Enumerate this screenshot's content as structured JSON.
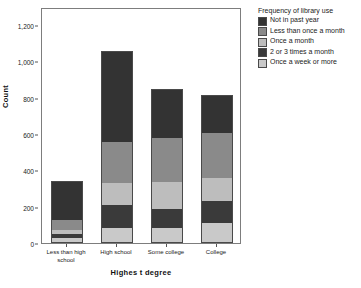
{
  "chart_data": {
    "type": "bar",
    "subtype": "stacked-bar",
    "title": "",
    "xlabel": "Highes t degree",
    "ylabel": "Count",
    "ylim": [
      0,
      1300
    ],
    "yticks": [
      "200",
      "400",
      "600",
      "800",
      "1,000",
      "1,200"
    ],
    "ytick_values": [
      200,
      400,
      600,
      800,
      1000,
      1200
    ],
    "grid": false,
    "legend_position": "right",
    "legend_title": "Frequency of library use",
    "categories": [
      "Less than high school",
      "High school",
      "Some college",
      "College"
    ],
    "series": [
      {
        "name": "Once a week or more",
        "color": "#c9c9c9",
        "values": [
          25,
          85,
          80,
          110
        ]
      },
      {
        "name": "2 or 3 times a month",
        "color": "#3a3a3a",
        "values": [
          25,
          125,
          110,
          120
        ]
      },
      {
        "name": "Once a month",
        "color": "#bdbdbd",
        "values": [
          20,
          120,
          145,
          130
        ]
      },
      {
        "name": "Less than once a month",
        "color": "#8a8a8a",
        "values": [
          55,
          225,
          245,
          245
        ]
      },
      {
        "name": "Not in past year",
        "color": "#333333",
        "values": [
          215,
          505,
          270,
          210
        ]
      }
    ],
    "totals": [
      340,
      1060,
      850,
      815
    ]
  },
  "legend": {
    "title": "Frequency of library use",
    "items": [
      {
        "label": "Not in past year",
        "color": "#333333"
      },
      {
        "label": "Less than once a month",
        "color": "#8a8a8a"
      },
      {
        "label": "Once a month",
        "color": "#bdbdbd"
      },
      {
        "label": "2 or 3 times a month",
        "color": "#3a3a3a"
      },
      {
        "label": "Once a week or more",
        "color": "#c9c9c9"
      }
    ]
  },
  "axes": {
    "y_title": "Count",
    "x_title": "Highes t degree",
    "zero_label": "0"
  }
}
